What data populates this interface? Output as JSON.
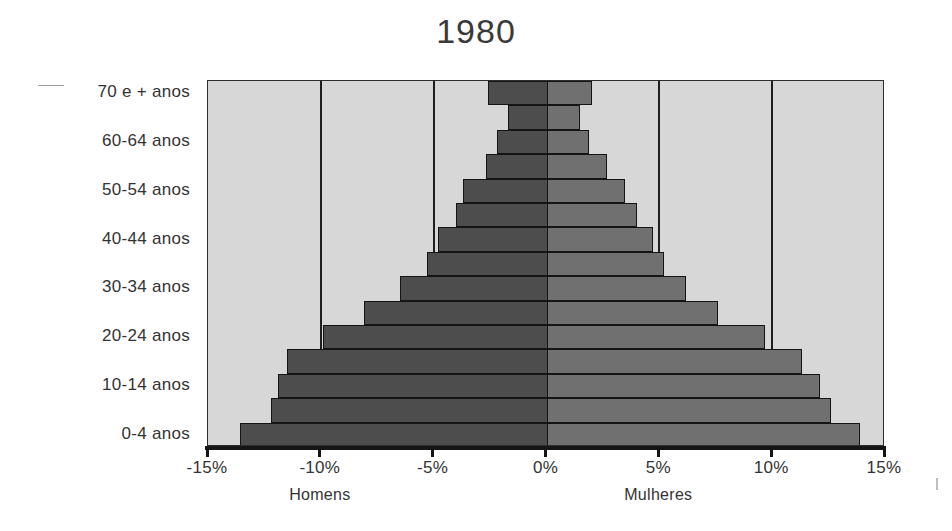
{
  "chart_data": {
    "type": "bar",
    "subtype": "population-pyramid",
    "title": "1980",
    "xlabel": "",
    "ylabel": "",
    "xlim": [
      -15,
      15
    ],
    "x_ticks": [
      -15,
      -10,
      -5,
      0,
      5,
      10,
      15
    ],
    "x_tick_labels": [
      "-15%",
      "-10%",
      "-5%",
      "0%",
      "5%",
      "10%",
      "15%"
    ],
    "grid": true,
    "grid_axis": "x",
    "legend": false,
    "legend_position": "below-axis",
    "categories": [
      "70 e + anos",
      "65-69 anos",
      "60-64 anos",
      "55-59 anos",
      "50-54 anos",
      "45-49 anos",
      "40-44 anos",
      "35-39 anos",
      "30-34 anos",
      "25-29 anos",
      "20-24 anos",
      "15-19 anos",
      "10-14 anos",
      "5-9 anos",
      "0-4 anos"
    ],
    "visible_category_labels": [
      "70 e + anos",
      "60-64 anos",
      "50-54 anos",
      "40-44 anos",
      "30-34 anos",
      "20-24 anos",
      "10-14 anos",
      "0-4 anos"
    ],
    "series": [
      {
        "name": "Homens",
        "side": "left",
        "color": "#4d4d4d",
        "values": [
          2.6,
          1.7,
          2.2,
          2.7,
          3.7,
          4.0,
          4.8,
          5.3,
          6.5,
          8.1,
          9.9,
          11.5,
          11.9,
          12.2,
          13.6
        ]
      },
      {
        "name": "Mulheres",
        "side": "right",
        "color": "#707070",
        "values": [
          2.0,
          1.5,
          1.9,
          2.7,
          3.5,
          4.0,
          4.7,
          5.2,
          6.2,
          7.6,
          9.7,
          11.3,
          12.1,
          12.6,
          13.9
        ]
      }
    ]
  },
  "captions": {
    "left": "Homens",
    "right": "Mulheres"
  },
  "colors": {
    "plot_background": "#d7d7d7",
    "gridline": "#1e1e1e",
    "male_bar": "#4d4d4d",
    "female_bar": "#707070",
    "text": "#333333",
    "page_background": "#ffffff"
  }
}
